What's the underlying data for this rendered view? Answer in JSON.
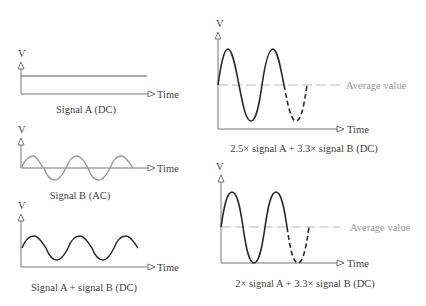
{
  "panels": [
    {
      "id": "signal-a",
      "y_label": "V",
      "x_label": "Time",
      "caption": "Signal A (DC)",
      "waveform": "constant"
    },
    {
      "id": "signal-b",
      "y_label": "V",
      "x_label": "Time",
      "caption": "Signal B (AC)",
      "waveform": "sine, 3 cycles, centered on time axis"
    },
    {
      "id": "signal-a-plus-b",
      "y_label": "V",
      "x_label": "Time",
      "caption": "Signal A + signal B (DC)",
      "waveform": "sine, 3 cycles, offset above time axis"
    },
    {
      "id": "scaled-2-5",
      "y_label": "V",
      "x_label": "Time",
      "caption": "2.5× signal A + 3.3× signal B (DC)",
      "average_label": "Average value",
      "waveform": "large sine, 2 cycles solid + dashed continuation"
    },
    {
      "id": "scaled-2",
      "y_label": "V",
      "x_label": "Time",
      "caption": "2× signal A + 3.3× signal B (DC)",
      "average_label": "Average value",
      "waveform": "large sine touching time axis, 2 cycles solid + dashed continuation"
    }
  ],
  "colors": {
    "axis": "#777777",
    "signal_dark": "#2a2a2a",
    "signal_light": "#999999",
    "average_line": "#bbbbbb",
    "text": "#444444",
    "text_light": "#999999"
  }
}
